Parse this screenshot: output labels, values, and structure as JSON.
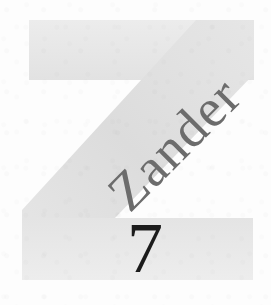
{
  "page": {
    "width": 271,
    "height": 305,
    "background_color": "#fdfdfd",
    "kind": "book-chapter-opening-drop-cap"
  },
  "dropcap": {
    "letter": "Z",
    "color": "#e9e9e9",
    "shade_color": "#dedede",
    "icon_name": "dropcap-letter-z"
  },
  "initial_word": {
    "text": "Zander",
    "color": "#6c6c6c",
    "rotation_degrees": -45
  },
  "chapter_number": {
    "value": "7",
    "color": "#1b1b1b"
  }
}
